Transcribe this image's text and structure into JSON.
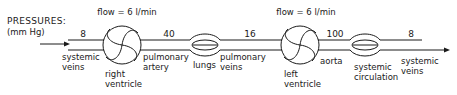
{
  "header": {
    "title": "PRESSURES:",
    "units": "(mm Hg)"
  },
  "flows": [
    {
      "label": "flow = 6 l/min"
    },
    {
      "label": "flow = 6 l/min"
    }
  ],
  "pressures": [
    {
      "segment": "systemic veins (in)",
      "value": "8"
    },
    {
      "segment": "pulmonary artery",
      "value": "40"
    },
    {
      "segment": "pulmonary veins",
      "value": "16"
    },
    {
      "segment": "aorta",
      "value": "100"
    },
    {
      "segment": "systemic veins (out)",
      "value": "8"
    }
  ],
  "components": {
    "systemic_veins_in": {
      "line1": "systemic",
      "line2": "veins"
    },
    "right_ventricle": {
      "line1": "right",
      "line2": "ventricle"
    },
    "pulmonary_artery": {
      "line1": "pulmonary",
      "line2": "artery"
    },
    "lungs": {
      "line1": "lungs"
    },
    "pulmonary_veins": {
      "line1": "pulmonary",
      "line2": "veins"
    },
    "left_ventricle": {
      "line1": "left",
      "line2": "ventricle"
    },
    "aorta": {
      "line1": "aorta"
    },
    "systemic_circulation": {
      "line1": "systemic",
      "line2": "circulation"
    },
    "systemic_veins_out": {
      "line1": "systemic",
      "line2": "veins"
    }
  },
  "colors": {
    "ink": "#1a1a1a",
    "background": "#ffffff"
  }
}
